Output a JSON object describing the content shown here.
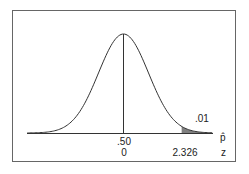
{
  "chart_data": {
    "type": "area",
    "title": "",
    "curve": "normal",
    "mean": 0,
    "x_axis_rows": [
      {
        "name": "p-hat",
        "label": "p̂",
        "ticks": [
          {
            "position": 0,
            "label": ".50"
          }
        ]
      },
      {
        "name": "z",
        "label": "z",
        "ticks": [
          {
            "position": 0,
            "label": "0"
          },
          {
            "position": 2.326,
            "label": "2.326"
          }
        ]
      }
    ],
    "shaded_region": {
      "from_z": 2.326,
      "to_z": "inf",
      "area_label": ".01",
      "area": 0.01
    },
    "center_line_z": 0,
    "grid": false,
    "legend": false
  },
  "labels": {
    "tail_area": ".01",
    "phat_center": ".50",
    "z_center": "0",
    "z_critical": "2.326",
    "phat_axis": "p̂",
    "z_axis": "z"
  },
  "colors": {
    "curve": "#333333",
    "shade": "#808080",
    "border": "#555555"
  }
}
